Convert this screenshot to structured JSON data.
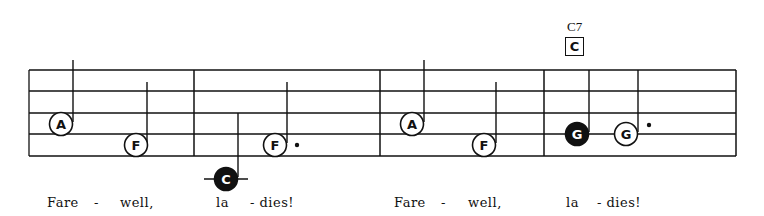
{
  "chord": {
    "name": "C7",
    "box_letter": "C"
  },
  "staff": {
    "line_count": 5,
    "line_y": [
      70,
      91,
      113,
      134,
      156
    ],
    "left": 29,
    "right": 736,
    "barlines_x": [
      194,
      380,
      544,
      736
    ]
  },
  "colors": {
    "ink": "#111111",
    "paper": "#ffffff"
  },
  "notes": [
    {
      "letter": "A",
      "filled": false,
      "cx": 61,
      "cy": 124,
      "stem_x": 73,
      "stem_top": 60,
      "dotted": false,
      "ledger": false
    },
    {
      "letter": "F",
      "filled": false,
      "cx": 136,
      "cy": 145,
      "stem_x": 147,
      "stem_top": 82,
      "dotted": false,
      "ledger": false
    },
    {
      "letter": "C",
      "filled": true,
      "cx": 226,
      "cy": 179,
      "stem_x": 238,
      "stem_top": 113,
      "dotted": false,
      "ledger": true
    },
    {
      "letter": "F",
      "filled": false,
      "cx": 275,
      "cy": 145,
      "stem_x": 287,
      "stem_top": 82,
      "dotted": true,
      "dot_x": 297,
      "dot_y": 145,
      "ledger": false
    },
    {
      "letter": "A",
      "filled": false,
      "cx": 412,
      "cy": 124,
      "stem_x": 424,
      "stem_top": 60,
      "dotted": false,
      "ledger": false
    },
    {
      "letter": "F",
      "filled": false,
      "cx": 484,
      "cy": 145,
      "stem_x": 496,
      "stem_top": 82,
      "dotted": false,
      "ledger": false
    },
    {
      "letter": "G",
      "filled": true,
      "cx": 577,
      "cy": 134,
      "stem_x": 589,
      "stem_top": 70,
      "dotted": false,
      "ledger": false
    },
    {
      "letter": "G",
      "filled": false,
      "cx": 626,
      "cy": 134,
      "stem_x": 638,
      "stem_top": 70,
      "dotted": true,
      "dot_x": 649,
      "dot_y": 125,
      "ledger": false
    }
  ],
  "lyrics": [
    {
      "text": "Fare",
      "x": 47
    },
    {
      "text": "-",
      "x": 94
    },
    {
      "text": "well,",
      "x": 120
    },
    {
      "text": "la",
      "x": 216
    },
    {
      "text": "- dies!",
      "x": 250
    },
    {
      "text": "Fare",
      "x": 394
    },
    {
      "text": "-",
      "x": 441
    },
    {
      "text": "well,",
      "x": 468
    },
    {
      "text": "la",
      "x": 566
    },
    {
      "text": "- dies!",
      "x": 597
    }
  ]
}
